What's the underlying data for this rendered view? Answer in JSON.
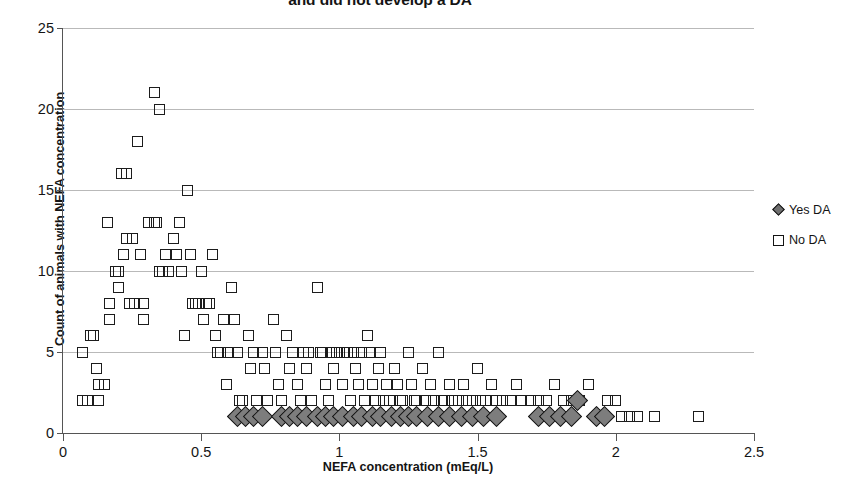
{
  "chart_data": {
    "type": "scatter",
    "title": "and did not develop a DA",
    "title_note": "title is cropped at the top edge of the screenshot",
    "xlabel": "NEFA concentration (mEq/L)",
    "ylabel": "Count of animals with NEFA concentration",
    "xlim": [
      0,
      2.5
    ],
    "ylim": [
      0,
      25
    ],
    "xticks": [
      "0",
      "0.5",
      "1",
      "1.5",
      "2",
      "2.5"
    ],
    "xtick_values": [
      0,
      0.5,
      1,
      1.5,
      2,
      2.5
    ],
    "yticks": [
      "0",
      "5",
      "10",
      "15",
      "20",
      "25"
    ],
    "ytick_values": [
      0,
      5,
      10,
      15,
      20,
      25
    ],
    "grid": "horizontal",
    "legend_position": "right",
    "series": [
      {
        "name": "Yes DA",
        "marker": "diamond",
        "marker_fill": "#7d7d7d",
        "marker_edge": "#111111",
        "points": [
          [
            0.63,
            1
          ],
          [
            0.66,
            1
          ],
          [
            0.69,
            1
          ],
          [
            0.72,
            1
          ],
          [
            0.79,
            1
          ],
          [
            0.82,
            1
          ],
          [
            0.85,
            1
          ],
          [
            0.88,
            1
          ],
          [
            0.92,
            1
          ],
          [
            0.95,
            1
          ],
          [
            0.98,
            1
          ],
          [
            1.01,
            1
          ],
          [
            1.05,
            1
          ],
          [
            1.08,
            1
          ],
          [
            1.12,
            1
          ],
          [
            1.15,
            1
          ],
          [
            1.19,
            1
          ],
          [
            1.22,
            1
          ],
          [
            1.25,
            1
          ],
          [
            1.28,
            1
          ],
          [
            1.32,
            1
          ],
          [
            1.36,
            1
          ],
          [
            1.4,
            1
          ],
          [
            1.44,
            1
          ],
          [
            1.48,
            1
          ],
          [
            1.52,
            1
          ],
          [
            1.57,
            1
          ],
          [
            1.72,
            1
          ],
          [
            1.76,
            1
          ],
          [
            1.8,
            1
          ],
          [
            1.84,
            1
          ],
          [
            1.86,
            2
          ],
          [
            1.93,
            1
          ],
          [
            1.96,
            1
          ]
        ]
      },
      {
        "name": "No DA",
        "marker": "square",
        "marker_fill": "none",
        "marker_edge": "#1c1c1c",
        "points": [
          [
            0.07,
            5
          ],
          [
            0.07,
            2
          ],
          [
            0.09,
            2
          ],
          [
            0.1,
            6
          ],
          [
            0.11,
            6
          ],
          [
            0.12,
            4
          ],
          [
            0.13,
            3
          ],
          [
            0.13,
            2
          ],
          [
            0.15,
            3
          ],
          [
            0.16,
            13
          ],
          [
            0.17,
            7
          ],
          [
            0.17,
            8
          ],
          [
            0.19,
            10
          ],
          [
            0.2,
            9
          ],
          [
            0.2,
            10
          ],
          [
            0.21,
            16
          ],
          [
            0.22,
            11
          ],
          [
            0.23,
            16
          ],
          [
            0.23,
            12
          ],
          [
            0.24,
            8
          ],
          [
            0.25,
            12
          ],
          [
            0.26,
            8
          ],
          [
            0.27,
            18
          ],
          [
            0.28,
            11
          ],
          [
            0.29,
            7
          ],
          [
            0.29,
            8
          ],
          [
            0.31,
            13
          ],
          [
            0.33,
            13
          ],
          [
            0.33,
            21
          ],
          [
            0.34,
            13
          ],
          [
            0.35,
            20
          ],
          [
            0.35,
            10
          ],
          [
            0.36,
            10
          ],
          [
            0.37,
            11
          ],
          [
            0.38,
            10
          ],
          [
            0.4,
            12
          ],
          [
            0.41,
            11
          ],
          [
            0.42,
            13
          ],
          [
            0.43,
            10
          ],
          [
            0.44,
            6
          ],
          [
            0.45,
            15
          ],
          [
            0.46,
            11
          ],
          [
            0.47,
            8
          ],
          [
            0.48,
            8
          ],
          [
            0.49,
            8
          ],
          [
            0.5,
            10
          ],
          [
            0.51,
            7
          ],
          [
            0.52,
            8
          ],
          [
            0.53,
            8
          ],
          [
            0.54,
            11
          ],
          [
            0.55,
            6
          ],
          [
            0.56,
            5
          ],
          [
            0.57,
            5
          ],
          [
            0.58,
            7
          ],
          [
            0.59,
            3
          ],
          [
            0.6,
            5
          ],
          [
            0.61,
            9
          ],
          [
            0.62,
            7
          ],
          [
            0.63,
            5
          ],
          [
            0.64,
            2
          ],
          [
            0.65,
            2
          ],
          [
            0.67,
            6
          ],
          [
            0.68,
            4
          ],
          [
            0.69,
            5
          ],
          [
            0.7,
            2
          ],
          [
            0.72,
            5
          ],
          [
            0.73,
            4
          ],
          [
            0.74,
            2
          ],
          [
            0.76,
            7
          ],
          [
            0.77,
            5
          ],
          [
            0.78,
            3
          ],
          [
            0.79,
            2
          ],
          [
            0.81,
            6
          ],
          [
            0.82,
            4
          ],
          [
            0.83,
            5
          ],
          [
            0.85,
            3
          ],
          [
            0.86,
            2
          ],
          [
            0.87,
            5
          ],
          [
            0.88,
            4
          ],
          [
            0.89,
            5
          ],
          [
            0.9,
            2
          ],
          [
            0.92,
            9
          ],
          [
            0.93,
            5
          ],
          [
            0.94,
            5
          ],
          [
            0.95,
            3
          ],
          [
            0.96,
            2
          ],
          [
            0.97,
            5
          ],
          [
            0.98,
            4
          ],
          [
            0.99,
            5
          ],
          [
            1.0,
            5
          ],
          [
            1.01,
            3
          ],
          [
            1.02,
            5
          ],
          [
            1.03,
            5
          ],
          [
            1.04,
            2
          ],
          [
            1.05,
            5
          ],
          [
            1.06,
            4
          ],
          [
            1.07,
            3
          ],
          [
            1.08,
            5
          ],
          [
            1.09,
            2
          ],
          [
            1.1,
            6
          ],
          [
            1.11,
            5
          ],
          [
            1.12,
            3
          ],
          [
            1.13,
            2
          ],
          [
            1.14,
            4
          ],
          [
            1.15,
            5
          ],
          [
            1.16,
            2
          ],
          [
            1.17,
            3
          ],
          [
            1.18,
            2
          ],
          [
            1.2,
            4
          ],
          [
            1.21,
            3
          ],
          [
            1.22,
            2
          ],
          [
            1.23,
            2
          ],
          [
            1.25,
            5
          ],
          [
            1.26,
            3
          ],
          [
            1.27,
            2
          ],
          [
            1.28,
            2
          ],
          [
            1.3,
            4
          ],
          [
            1.31,
            2
          ],
          [
            1.33,
            3
          ],
          [
            1.34,
            2
          ],
          [
            1.36,
            5
          ],
          [
            1.37,
            2
          ],
          [
            1.38,
            2
          ],
          [
            1.4,
            3
          ],
          [
            1.41,
            2
          ],
          [
            1.43,
            2
          ],
          [
            1.45,
            3
          ],
          [
            1.46,
            2
          ],
          [
            1.48,
            2
          ],
          [
            1.5,
            4
          ],
          [
            1.51,
            2
          ],
          [
            1.53,
            2
          ],
          [
            1.55,
            3
          ],
          [
            1.57,
            2
          ],
          [
            1.59,
            2
          ],
          [
            1.62,
            2
          ],
          [
            1.64,
            3
          ],
          [
            1.66,
            2
          ],
          [
            1.69,
            2
          ],
          [
            1.72,
            2
          ],
          [
            1.75,
            2
          ],
          [
            1.78,
            3
          ],
          [
            1.81,
            2
          ],
          [
            1.84,
            2
          ],
          [
            1.87,
            2
          ],
          [
            1.9,
            3
          ],
          [
            1.97,
            2
          ],
          [
            2.0,
            2
          ],
          [
            2.02,
            1
          ],
          [
            2.05,
            1
          ],
          [
            2.08,
            1
          ],
          [
            2.14,
            1
          ],
          [
            2.3,
            1
          ]
        ]
      }
    ]
  },
  "legend": {
    "items": [
      {
        "label": "Yes DA",
        "marker": "diamond-marker-icon"
      },
      {
        "label": "No DA",
        "marker": "square-marker-icon"
      }
    ]
  },
  "colors": {
    "axis": "#555555",
    "gridline": "#b9b9b9",
    "marker_edge": "#1c1c1c",
    "diamond_fill": "#7d7d7d",
    "text": "#141414",
    "background": "#ffffff"
  }
}
